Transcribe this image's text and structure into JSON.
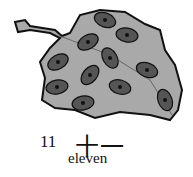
{
  "illustration": {
    "subject": "leaf with ladybugs",
    "ladybug_count": 11,
    "colors": {
      "leaf": "#a9a9a9",
      "outline": "#111111",
      "ladybug": "#555555",
      "spot": "#111111"
    }
  },
  "caption": {
    "numeral": "11",
    "chinese": "十一",
    "word": "eleven"
  }
}
